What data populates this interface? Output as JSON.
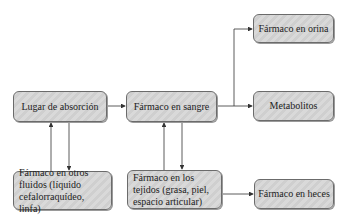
{
  "diagram": {
    "nodes": [
      {
        "id": "absorcion",
        "label": "Lugar de absorción"
      },
      {
        "id": "sangre",
        "label": "Fármaco en sangre"
      },
      {
        "id": "orina",
        "label": "Fármaco en orina"
      },
      {
        "id": "metabolitos",
        "label": "Metabolitos"
      },
      {
        "id": "fluidos",
        "label": "Fármaco en otros fluidos (líquido cefalorraquídeo, linfa)"
      },
      {
        "id": "tejidos",
        "label": "Fármaco en los tejidos (grasa, piel, espacio articular)"
      },
      {
        "id": "heces",
        "label": "Fármaco en heces"
      }
    ],
    "edges": [
      {
        "from": "absorcion",
        "to": "sangre"
      },
      {
        "from": "sangre",
        "to": "orina"
      },
      {
        "from": "sangre",
        "to": "metabolitos"
      },
      {
        "from": "absorcion",
        "to": "fluidos"
      },
      {
        "from": "fluidos",
        "to": "absorcion"
      },
      {
        "from": "sangre",
        "to": "tejidos"
      },
      {
        "from": "tejidos",
        "to": "sangre"
      },
      {
        "from": "tejidos",
        "to": "heces"
      }
    ],
    "colors": {
      "box_fill": "#d5d5d5",
      "box_border": "#6b6b6b",
      "arrow": "#333333"
    }
  }
}
